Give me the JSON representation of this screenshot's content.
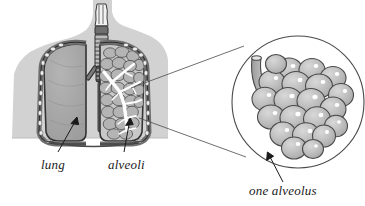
{
  "figure": {
    "type": "anatomical-illustration",
    "background_color": "#ffffff"
  },
  "labels": {
    "lung": "lung",
    "alveoli": "alveoli",
    "one_alveolus": "one alveolus"
  },
  "colors": {
    "body_silhouette": "#d2d2d2",
    "lung_fill": "#a9a9a9",
    "lung_outline": "#3a3a3a",
    "pleura_band": "#8a8a8a",
    "rib_node": "#ececec",
    "bronchial_tree": "#ffffff",
    "lobule_fill": "#b4b4b4",
    "trachea_fill": "#6f6f6f",
    "alveolus_fill": "#bdbdbd",
    "alveolus_outline": "#4a4a4a",
    "alveolus_highlight": "#ffffff",
    "bronchiole_fill": "#b0b0b0",
    "circle_outline": "#4a4a4a",
    "leader_line": "#4a4a4a",
    "arrow": "#1a1a1a",
    "text": "#1a1a1a"
  },
  "parts": {
    "body_silhouette": "head-neck-and-torso profile",
    "trachea": "windpipe with horizontal cartilage rings",
    "left_lung": "solid cut-away lung",
    "right_lung": "lung showing branching bronchial tree and alveolar lobules",
    "magnifier_circle": "enlarged detail view",
    "bronchiole": "terminal airway tube entering alveolar cluster",
    "alveolar_cluster": "grape-like bunch of alveoli"
  },
  "magnifier": {
    "center_x": 298,
    "center_y": 102,
    "radius": 67,
    "alveoli_count": 21
  }
}
